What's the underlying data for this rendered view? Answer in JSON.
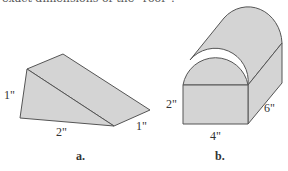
{
  "caption_top": "exact dimensions of the \"roof\"?",
  "figures": [
    {
      "id": "a",
      "label": "a.",
      "shape": "triangular prism (wedge)",
      "dimensions": {
        "height": "1\"",
        "base": "2\"",
        "depth": "1\""
      }
    },
    {
      "id": "b",
      "label": "b.",
      "shape": "box with half-cylinder roof",
      "dimensions": {
        "height": "2\"",
        "width": "4\"",
        "depth": "6\""
      }
    }
  ],
  "colors": {
    "fill": "#d4d4d4",
    "stroke": "#555555"
  }
}
